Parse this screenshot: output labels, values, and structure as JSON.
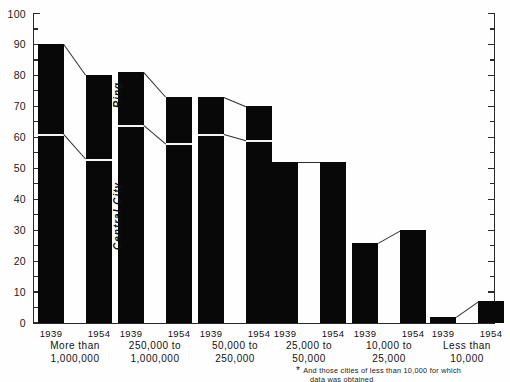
{
  "chart_data": {
    "type": "bar",
    "title": "",
    "subtitle": "",
    "xlabel": "",
    "ylabel": "",
    "ylim": [
      0,
      100
    ],
    "ytick_step": 10,
    "yminor_step": 5,
    "ytick_labels": [
      "0",
      "10",
      "20",
      "30",
      "40",
      "50",
      "60",
      "70",
      "80",
      "90",
      "100"
    ],
    "grid": false,
    "legend_position": "inline-annotations",
    "series_annotations": [
      "Ring",
      "Central City"
    ],
    "categories": [
      "More than 1,000,000",
      "250,000 to 1,000,000",
      "50,000 to 250,000",
      "25,000 to 50,000",
      "10,000 to 25,000",
      "Less than 10,000"
    ],
    "year_labels": [
      "1939",
      "1954"
    ],
    "groups": [
      {
        "category_line1": "More than",
        "category_line2": "1,000,000",
        "bars": [
          {
            "year": "1939",
            "total": 90,
            "central_city": 61,
            "ring": 29
          },
          {
            "year": "1954",
            "total": 80,
            "central_city": 53,
            "ring": 27
          }
        ]
      },
      {
        "category_line1": "250,000 to",
        "category_line2": "1,000,000",
        "bars": [
          {
            "year": "1939",
            "total": 81,
            "central_city": 64,
            "ring": 17
          },
          {
            "year": "1954",
            "total": 73,
            "central_city": 58,
            "ring": 15
          }
        ]
      },
      {
        "category_line1": "50,000 to",
        "category_line2": "250,000",
        "bars": [
          {
            "year": "1939",
            "total": 73,
            "central_city": 61,
            "ring": 12
          },
          {
            "year": "1954",
            "total": 70,
            "central_city": 59,
            "ring": 11
          }
        ]
      },
      {
        "category_line1": "25,000 to",
        "category_line2": "50,000",
        "bars": [
          {
            "year": "1939",
            "total": 52,
            "central_city": 52,
            "ring": 0
          },
          {
            "year": "1954",
            "total": 52,
            "central_city": 52,
            "ring": 0
          }
        ]
      },
      {
        "category_line1": "10,000 to",
        "category_line2": "25,000",
        "bars": [
          {
            "year": "1939",
            "total": 26,
            "central_city": 26,
            "ring": 0
          },
          {
            "year": "1954",
            "total": 30,
            "central_city": 30,
            "ring": 0
          }
        ]
      },
      {
        "category_line1": "Less than",
        "category_line2": "10,000",
        "bars": [
          {
            "year": "1939",
            "total": 2,
            "central_city": 2,
            "ring": 0
          },
          {
            "year": "1954",
            "total": 7,
            "central_city": 7,
            "ring": 0
          }
        ]
      }
    ],
    "bar_color": "#080808",
    "axis_color": "#2a2a2a",
    "background_color": "#fefefe"
  },
  "footnote": {
    "marker": "*",
    "line1": "And those cities of less than 10,000 for which",
    "line2": "data was obtained"
  },
  "annotations": {
    "ring_label": "Ring",
    "central_city_label": "Central City"
  }
}
